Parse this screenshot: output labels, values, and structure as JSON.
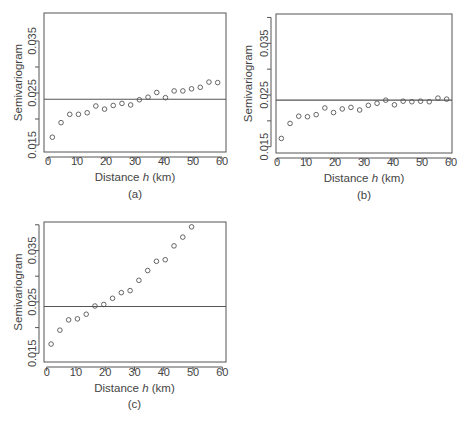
{
  "chart_data": [
    {
      "type": "scatter",
      "panel_label": "(a)",
      "title": "",
      "xlabel": "Distance h (km)",
      "xlabel_parts": [
        "Distance ",
        "h",
        " (km)"
      ],
      "ylabel": "Semivariogram",
      "xlim": [
        0,
        60
      ],
      "ylim": [
        0.0133,
        0.0405
      ],
      "xticks": [
        0,
        10,
        20,
        30,
        40,
        50,
        60
      ],
      "yticks": [
        0.015,
        0.02,
        0.025,
        0.03,
        0.035
      ],
      "ytick_labels": [
        "0.015",
        "",
        "0.025",
        "",
        "0.035"
      ],
      "grid": false,
      "legend": null,
      "reference_line": {
        "orientation": "horizontal",
        "y": 0.0238
      },
      "x": [
        1.5,
        4.5,
        7.5,
        10.5,
        13.5,
        16.5,
        19.5,
        22.5,
        25.5,
        28.5,
        31.5,
        34.5,
        37.5,
        40.5,
        43.5,
        46.5,
        49.5,
        52.5,
        55.5,
        58.5
      ],
      "y": [
        0.0165,
        0.0193,
        0.0209,
        0.0209,
        0.0212,
        0.0225,
        0.0219,
        0.0226,
        0.023,
        0.0227,
        0.0237,
        0.0242,
        0.0251,
        0.0241,
        0.0254,
        0.0254,
        0.0258,
        0.0261,
        0.0271,
        0.027
      ]
    },
    {
      "type": "scatter",
      "panel_label": "(b)",
      "title": "",
      "xlabel": "Distance h (km)",
      "xlabel_parts": [
        "Distance ",
        "h",
        " (km)"
      ],
      "ylabel": "Semivariogram",
      "xlim": [
        0,
        60
      ],
      "ylim": [
        0.0138,
        0.0403
      ],
      "xticks": [
        0,
        10,
        20,
        30,
        40,
        50,
        60
      ],
      "yticks": [
        0.015,
        0.02,
        0.025,
        0.03,
        0.035,
        0.04
      ],
      "ytick_labels": [
        "0.015",
        "",
        "0.025",
        "",
        "0.035",
        ""
      ],
      "grid": false,
      "legend": null,
      "reference_line": {
        "orientation": "horizontal",
        "y": 0.024
      },
      "x": [
        1.5,
        4.5,
        7.5,
        10.5,
        13.5,
        16.5,
        19.5,
        22.5,
        25.5,
        28.5,
        31.5,
        34.5,
        37.5,
        40.5,
        43.5,
        46.5,
        49.5,
        52.5,
        55.5,
        58.5
      ],
      "y": [
        0.0166,
        0.0195,
        0.0209,
        0.0208,
        0.0212,
        0.0225,
        0.0216,
        0.0223,
        0.0226,
        0.0221,
        0.023,
        0.0234,
        0.024,
        0.0231,
        0.0238,
        0.0237,
        0.0238,
        0.0237,
        0.0244,
        0.0242
      ]
    },
    {
      "type": "scatter",
      "panel_label": "(c)",
      "title": "",
      "xlabel": "Distance h (km)",
      "xlabel_parts": [
        "Distance ",
        "h",
        " (km)"
      ],
      "ylabel": "Semivariogram",
      "xlim": [
        0,
        60
      ],
      "ylim": [
        0.0133,
        0.0407
      ],
      "xticks": [
        0,
        10,
        20,
        30,
        40,
        50,
        60
      ],
      "yticks": [
        0.015,
        0.02,
        0.025,
        0.03,
        0.035,
        0.04
      ],
      "ytick_labels": [
        "0.015",
        "",
        "0.025",
        "",
        "0.035",
        ""
      ],
      "grid": false,
      "legend": null,
      "reference_line": {
        "orientation": "horizontal",
        "y": 0.0241
      },
      "x": [
        1.5,
        4.5,
        7.5,
        10.5,
        13.5,
        16.5,
        19.5,
        22.5,
        25.5,
        28.5,
        31.5,
        34.5,
        37.5,
        40.5,
        43.5,
        46.5,
        49.5
      ],
      "y": [
        0.0168,
        0.0195,
        0.0215,
        0.0217,
        0.0226,
        0.0242,
        0.0245,
        0.0257,
        0.0268,
        0.0272,
        0.0292,
        0.0311,
        0.0329,
        0.0332,
        0.0359,
        0.0376,
        0.0396
      ]
    }
  ],
  "layout": {
    "panels": [
      {
        "box": [
          44,
          13,
          226,
          152
        ],
        "x0px": 48,
        "x60px": 222,
        "y015px": 145,
        "y025px": 93,
        "xtick_label_y": 165,
        "xlabel_y": 181,
        "panel_label_y": 198,
        "ylabel_x": 22,
        "ytick_label_x": 36
      },
      {
        "box": [
          276,
          14,
          452,
          153
        ],
        "x0px": 277,
        "x60px": 451,
        "y015px": 146.7,
        "y025px": 95,
        "xtick_label_y": 166,
        "xlabel_y": 182,
        "panel_label_y": 199,
        "ylabel_x": 252,
        "ytick_label_x": 268
      },
      {
        "box": [
          44,
          222,
          226,
          362
        ],
        "x0px": 46.7,
        "x60px": 222.3,
        "y015px": 353.3,
        "y025px": 301.9,
        "xtick_label_y": 376,
        "xlabel_y": 392,
        "panel_label_y": 408,
        "ylabel_x": 22,
        "ytick_label_x": 36
      }
    ]
  }
}
